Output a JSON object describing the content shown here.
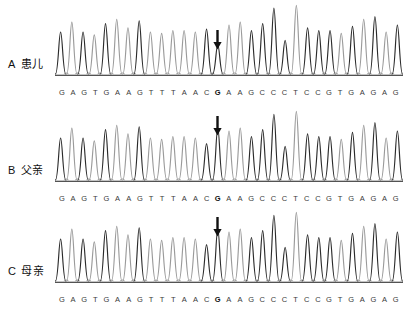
{
  "figure": {
    "title": "",
    "sequence": [
      "G",
      "A",
      "G",
      "T",
      "G",
      "A",
      "A",
      "G",
      "T",
      "T",
      "T",
      "A",
      "A",
      "C",
      "G",
      "A",
      "A",
      "G",
      "C",
      "C",
      "C",
      "T",
      "C",
      "C",
      "G",
      "T",
      "G",
      "A",
      "G",
      "A",
      "G"
    ],
    "marked_index": 14,
    "colors": {
      "peak_dark": "#2b2b2b",
      "peak_light": "#9a9a9a",
      "baseline": "#1a1a1a",
      "base_text": "#3a3a3a",
      "arrow": "#111111",
      "background": "#ffffff"
    }
  },
  "panels": [
    {
      "letter": "A",
      "label": "患儿",
      "label_full": "A 患儿",
      "arrow_present": true,
      "arrow_base": "G",
      "arrow_position_index": 14,
      "mutation_note": "heterozygous - reduced peak at marked G",
      "bases": [
        "G",
        "A",
        "G",
        "T",
        "G",
        "A",
        "A",
        "G",
        "T",
        "T",
        "T",
        "A",
        "A",
        "C",
        "G",
        "A",
        "A",
        "G",
        "C",
        "C",
        "C",
        "T",
        "C",
        "C",
        "G",
        "T",
        "G",
        "A",
        "G",
        "A",
        "G"
      ]
    },
    {
      "letter": "B",
      "label": "父亲",
      "label_full": "B 父亲",
      "arrow_present": true,
      "arrow_base": "G",
      "arrow_position_index": 14,
      "mutation_note": "normal - full height peak at marked G",
      "bases": [
        "G",
        "A",
        "G",
        "T",
        "G",
        "A",
        "A",
        "G",
        "T",
        "T",
        "T",
        "A",
        "A",
        "C",
        "G",
        "A",
        "A",
        "G",
        "C",
        "C",
        "C",
        "T",
        "C",
        "C",
        "G",
        "T",
        "G",
        "A",
        "G",
        "A",
        "G"
      ]
    },
    {
      "letter": "C",
      "label": "母亲",
      "label_full": "C 母亲",
      "arrow_present": true,
      "arrow_base": "G",
      "arrow_position_index": 14,
      "mutation_note": "normal - full height peak at marked G",
      "bases": [
        "G",
        "A",
        "G",
        "T",
        "G",
        "A",
        "A",
        "G",
        "T",
        "T",
        "T",
        "A",
        "A",
        "C",
        "G",
        "A",
        "A",
        "G",
        "C",
        "C",
        "C",
        "T",
        "C",
        "C",
        "G",
        "T",
        "G",
        "A",
        "G",
        "A",
        "G"
      ]
    }
  ],
  "chart_data": {
    "type": "line",
    "subtitle": "Three traces: patient, father, mother",
    "xlabel": "Base position",
    "ylabel": "Fluorescence intensity (relative)",
    "xlim": [
      1,
      31
    ],
    "ylim": [
      0,
      100
    ],
    "grid": false,
    "legend": "none",
    "categories": [
      "G",
      "A",
      "G",
      "T",
      "G",
      "A",
      "A",
      "G",
      "T",
      "T",
      "T",
      "A",
      "A",
      "C",
      "G",
      "A",
      "A",
      "G",
      "C",
      "C",
      "C",
      "T",
      "C",
      "C",
      "G",
      "T",
      "G",
      "A",
      "G",
      "A",
      "G"
    ],
    "annotations": [
      {
        "panel": "A",
        "text": "arrow",
        "at_index": 14,
        "base": "G"
      },
      {
        "panel": "B",
        "text": "arrow",
        "at_index": 14,
        "base": "G"
      },
      {
        "panel": "C",
        "text": "arrow",
        "at_index": 14,
        "base": "G"
      }
    ],
    "series": [
      {
        "name": "A 患儿",
        "values": [
          60,
          74,
          60,
          56,
          72,
          78,
          66,
          76,
          60,
          58,
          62,
          62,
          60,
          64,
          42,
          70,
          74,
          62,
          72,
          94,
          48,
          98,
          66,
          62,
          62,
          58,
          68,
          78,
          82,
          60,
          70
        ],
        "peak_colors": [
          "dark",
          "light",
          "dark",
          "light",
          "dark",
          "light",
          "light",
          "dark",
          "light",
          "light",
          "light",
          "light",
          "light",
          "dark",
          "dark",
          "light",
          "light",
          "dark",
          "dark",
          "dark",
          "dark",
          "light",
          "dark",
          "dark",
          "dark",
          "light",
          "dark",
          "light",
          "dark",
          "light",
          "dark"
        ]
      },
      {
        "name": "B 父亲",
        "values": [
          60,
          74,
          60,
          56,
          72,
          78,
          66,
          76,
          60,
          58,
          62,
          62,
          60,
          52,
          74,
          70,
          74,
          62,
          72,
          94,
          48,
          98,
          66,
          62,
          62,
          58,
          68,
          78,
          82,
          60,
          70
        ],
        "peak_colors": [
          "dark",
          "light",
          "dark",
          "light",
          "dark",
          "light",
          "light",
          "dark",
          "light",
          "light",
          "light",
          "light",
          "light",
          "dark",
          "dark",
          "light",
          "light",
          "dark",
          "dark",
          "dark",
          "dark",
          "light",
          "dark",
          "dark",
          "dark",
          "light",
          "dark",
          "light",
          "dark",
          "light",
          "dark"
        ]
      },
      {
        "name": "C 母亲",
        "values": [
          60,
          74,
          60,
          56,
          72,
          78,
          66,
          76,
          60,
          58,
          62,
          62,
          60,
          52,
          74,
          70,
          74,
          62,
          72,
          94,
          48,
          98,
          66,
          62,
          62,
          58,
          68,
          78,
          82,
          60,
          70
        ],
        "peak_colors": [
          "dark",
          "light",
          "dark",
          "light",
          "dark",
          "light",
          "light",
          "dark",
          "light",
          "light",
          "light",
          "light",
          "light",
          "dark",
          "dark",
          "light",
          "light",
          "dark",
          "dark",
          "dark",
          "dark",
          "light",
          "dark",
          "dark",
          "dark",
          "light",
          "dark",
          "light",
          "dark",
          "light",
          "dark"
        ]
      }
    ]
  }
}
